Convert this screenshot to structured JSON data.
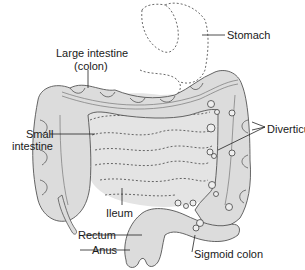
{
  "diagram": {
    "type": "anatomical-illustration",
    "labels": {
      "stomach": "Stomach",
      "large_intestine_line1": "Large intestine",
      "large_intestine_line2": "(colon)",
      "small_intestine_line1": "Small",
      "small_intestine_line2": "intestine",
      "diverticula": "Diverticula",
      "ileum": "Ileum",
      "rectum": "Rectum",
      "anus": "Anus",
      "sigmoid_colon": "Sigmoid colon"
    },
    "colors": {
      "organ_fill": "#dcdcdc",
      "organ_stroke": "#555555",
      "dashed_outline": "#444444",
      "text": "#1a1a1a",
      "background": "#ffffff"
    }
  }
}
